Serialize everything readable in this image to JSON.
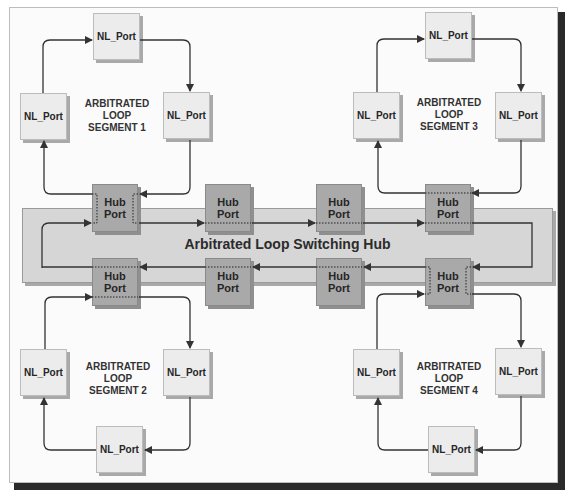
{
  "diagram": {
    "hub": {
      "title": "Arbitrated Loop Switching Hub",
      "port_label": "Hub\nPort",
      "top_ports": [
        {
          "label": "Hub Port",
          "x": 92,
          "y": 184
        },
        {
          "label": "Hub Port",
          "x": 205,
          "y": 184
        },
        {
          "label": "Hub Port",
          "x": 316,
          "y": 184
        },
        {
          "label": "Hub Port",
          "x": 425,
          "y": 184
        }
      ],
      "bottom_ports": [
        {
          "label": "Hub Port",
          "x": 92,
          "y": 258
        },
        {
          "label": "Hub Port",
          "x": 205,
          "y": 258
        },
        {
          "label": "Hub Port",
          "x": 316,
          "y": 258
        },
        {
          "label": "Hub Port",
          "x": 425,
          "y": 258
        }
      ]
    },
    "segments": [
      {
        "name": "ARBITRATED LOOP SEGMENT 1",
        "lines": [
          "ARBITRATED",
          "LOOP",
          "SEGMENT 1"
        ],
        "nodes": [
          "NL_Port",
          "NL_Port",
          "NL_Port"
        ]
      },
      {
        "name": "ARBITRATED LOOP SEGMENT 2",
        "lines": [
          "ARBITRATED",
          "LOOP",
          "SEGMENT 2"
        ],
        "nodes": [
          "NL_Port",
          "NL_Port",
          "NL_Port"
        ]
      },
      {
        "name": "ARBITRATED LOOP SEGMENT 3",
        "lines": [
          "ARBITRATED",
          "LOOP",
          "SEGMENT 3"
        ],
        "nodes": [
          "NL_Port",
          "NL_Port",
          "NL_Port"
        ]
      },
      {
        "name": "ARBITRATED LOOP SEGMENT 4",
        "lines": [
          "ARBITRATED",
          "LOOP",
          "SEGMENT 4"
        ],
        "nodes": [
          "NL_Port",
          "NL_Port",
          "NL_Port"
        ]
      }
    ],
    "node_label": "NL_Port",
    "hub_label_line1": "Hub",
    "hub_label_line2": "Port",
    "colors": {
      "nl_port_fill": "#ececec",
      "hub_port_fill": "#a9a9a9",
      "hub_band_fill": "#d6d6d6",
      "line": "#333333",
      "frame_shadow": "#2a2a2a"
    }
  }
}
